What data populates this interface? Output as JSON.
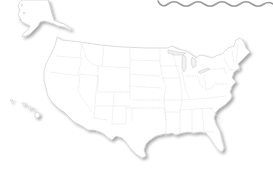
{
  "map": {
    "type": "blank outline map",
    "region": "United States",
    "regions_shown": [
      "Contiguous United States",
      "Alaska",
      "Hawaii"
    ],
    "labels": [],
    "style": {
      "land_fill": "#ffffff",
      "border_color": "#d2d2d2",
      "coast_color": "#c8c8c8",
      "shadow_color": "#bdbdbd",
      "wave_line_color": "#9a9a9a",
      "background": "#ffffff"
    },
    "decorations": {
      "torn_edge_wave": "wavy-line-top-right"
    }
  }
}
